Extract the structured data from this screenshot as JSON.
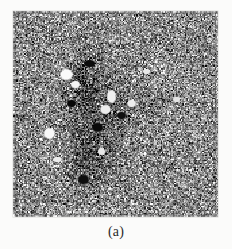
{
  "figure": {
    "caption": "(a)",
    "panel_label": "a",
    "background_color": "#fbfbfa",
    "caption_color": "#2a2a2a"
  },
  "image_panel": {
    "alt_description": "Grayscale speckle-noise image",
    "x": 13,
    "y": 11,
    "width": 205,
    "height": 206,
    "mean_gray": "#8a8a8a"
  },
  "chart_data": {
    "type": "heatmap",
    "title": "(a)",
    "xlabel": "",
    "ylabel": "",
    "grid": false,
    "legend": "none",
    "colormap": "grayscale",
    "value_range": [
      0,
      255
    ],
    "pixel_width": 205,
    "pixel_height": 206,
    "noise": {
      "model": "speckle",
      "base_level": 138,
      "amplitude": 108,
      "grain_px": 1.35
    },
    "regions": [
      {
        "name": "dark-vertical-band",
        "shape": "ellipse",
        "cx": 78,
        "cy": 105,
        "rx": 34,
        "ry": 86,
        "delta": -46
      },
      {
        "name": "dark-core-upper",
        "shape": "ellipse",
        "cx": 70,
        "cy": 70,
        "rx": 18,
        "ry": 36,
        "delta": -34
      },
      {
        "name": "dark-core-lower",
        "shape": "ellipse",
        "cx": 72,
        "cy": 150,
        "rx": 20,
        "ry": 42,
        "delta": -30
      },
      {
        "name": "dark-streak-center",
        "shape": "ellipse",
        "cx": 100,
        "cy": 112,
        "rx": 16,
        "ry": 58,
        "delta": -22
      },
      {
        "name": "mid-shadow-right",
        "shape": "ellipse",
        "cx": 124,
        "cy": 96,
        "rx": 26,
        "ry": 34,
        "delta": -14
      },
      {
        "name": "bright-haze-upper-right",
        "shape": "ellipse",
        "cx": 150,
        "cy": 62,
        "rx": 30,
        "ry": 22,
        "delta": 12
      }
    ],
    "bright_spots": [
      {
        "name": "spot-1",
        "cx": 53,
        "cy": 63,
        "rx": 7,
        "ry": 6,
        "value": 250
      },
      {
        "name": "spot-2",
        "cx": 62,
        "cy": 73,
        "rx": 5,
        "ry": 4,
        "value": 244
      },
      {
        "name": "spot-3",
        "cx": 98,
        "cy": 85,
        "rx": 5,
        "ry": 7,
        "value": 240
      },
      {
        "name": "spot-4",
        "cx": 92,
        "cy": 98,
        "rx": 6,
        "ry": 5,
        "value": 236
      },
      {
        "name": "spot-5",
        "cx": 36,
        "cy": 122,
        "rx": 6,
        "ry": 6,
        "value": 248
      },
      {
        "name": "spot-6",
        "cx": 118,
        "cy": 92,
        "rx": 5,
        "ry": 4,
        "value": 238
      },
      {
        "name": "spot-7",
        "cx": 133,
        "cy": 60,
        "rx": 4,
        "ry": 3,
        "value": 232
      },
      {
        "name": "spot-8",
        "cx": 88,
        "cy": 140,
        "rx": 4,
        "ry": 4,
        "value": 230
      },
      {
        "name": "spot-9",
        "cx": 44,
        "cy": 148,
        "rx": 5,
        "ry": 3,
        "value": 236
      },
      {
        "name": "spot-10",
        "cx": 163,
        "cy": 88,
        "rx": 4,
        "ry": 3,
        "value": 228
      }
    ],
    "dark_spots": [
      {
        "name": "dark-1",
        "cx": 76,
        "cy": 52,
        "rx": 6,
        "ry": 4,
        "value": 12
      },
      {
        "name": "dark-2",
        "cx": 84,
        "cy": 116,
        "rx": 6,
        "ry": 5,
        "value": 10
      },
      {
        "name": "dark-3",
        "cx": 70,
        "cy": 168,
        "rx": 6,
        "ry": 5,
        "value": 14
      },
      {
        "name": "dark-4",
        "cx": 108,
        "cy": 104,
        "rx": 5,
        "ry": 4,
        "value": 16
      },
      {
        "name": "dark-5",
        "cx": 58,
        "cy": 92,
        "rx": 5,
        "ry": 4,
        "value": 8
      }
    ]
  }
}
